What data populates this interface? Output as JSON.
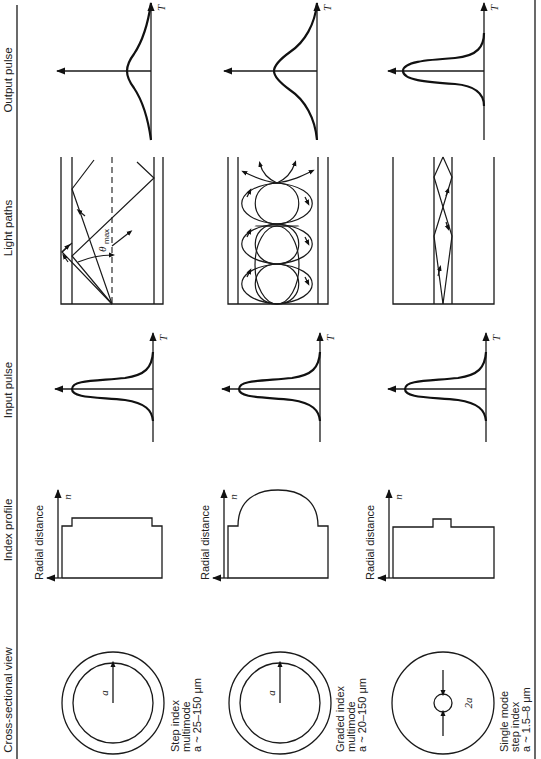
{
  "figure": {
    "orientation": "rotated 90 degrees counter-clockwise",
    "column_headers": {
      "cross_section": "Cross-sectional view",
      "index_profile": "Index profile",
      "input_pulse": "Input pulse",
      "light_paths": "Light paths",
      "output_pulse": "Output pulse"
    },
    "axis_labels": {
      "radial_distance": "Radial distance",
      "n": "n",
      "T": "T",
      "theta_max": "θ",
      "theta_max_sub": "max"
    },
    "fibers": [
      {
        "type_line1": "Step index",
        "type_line2": "multimode",
        "size": "a ~ 25–150 μm",
        "radius_label": "a"
      },
      {
        "type_line1": "Graded index",
        "type_line2": "multimode",
        "size": "a ~ 20–150 μm",
        "radius_label": "a"
      },
      {
        "type_line1": "Single mode",
        "type_line2": "step index",
        "size": "a ~ 1.5–8 μm",
        "radius_label": "2a"
      }
    ]
  }
}
